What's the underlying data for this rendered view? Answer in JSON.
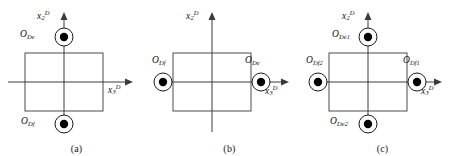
{
  "figure": {
    "type": "technical-diagram",
    "axis_labels": {
      "vertical_base": "x",
      "vertical_sub": "2",
      "vertical_sup": "D",
      "horizontal_base": "x",
      "horizontal_sub": "3",
      "horizontal_sup": "D"
    },
    "colors": {
      "stroke": "#3a3a3a",
      "axis": "#3a3a3a",
      "marker_fill": "#000000",
      "background": "#ffffff"
    }
  },
  "panels": [
    {
      "id": "a",
      "caption": "(a)",
      "markers": [
        {
          "name": "O_De",
          "base": "O",
          "sub": "De",
          "position": "top"
        },
        {
          "name": "O_Df",
          "base": "O",
          "sub": "Df",
          "position": "bottom"
        }
      ]
    },
    {
      "id": "b",
      "caption": "(b)",
      "markers": [
        {
          "name": "O_Df",
          "base": "O",
          "sub": "Df",
          "position": "left"
        },
        {
          "name": "O_De",
          "base": "O",
          "sub": "De",
          "position": "right"
        }
      ]
    },
    {
      "id": "c",
      "caption": "(c)",
      "markers": [
        {
          "name": "O_De1",
          "base": "O",
          "sub": "De1",
          "position": "top"
        },
        {
          "name": "O_Df2",
          "base": "O",
          "sub": "Df2",
          "position": "left"
        },
        {
          "name": "O_Df1",
          "base": "O",
          "sub": "Df1",
          "position": "right"
        },
        {
          "name": "O_De2",
          "base": "O",
          "sub": "De2",
          "position": "bottom"
        }
      ]
    }
  ]
}
